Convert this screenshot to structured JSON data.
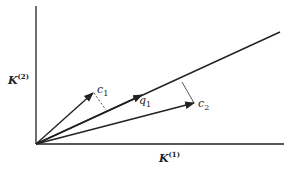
{
  "axes": {
    "x_label": "K",
    "x_label_superscript": "(1)",
    "y_label": "K",
    "y_label_superscript": "(2)"
  },
  "vectors": [
    {
      "name": "c1",
      "label": "c",
      "subscript": "1",
      "tip": [
        93,
        93
      ]
    },
    {
      "name": "q1",
      "label": "q",
      "subscript": "1",
      "tip": [
        280,
        32
      ]
    },
    {
      "name": "c2",
      "label": "c",
      "subscript": "2",
      "tip": [
        194,
        103
      ]
    }
  ],
  "projections": [
    {
      "from": "c1",
      "to_point_on_q1": [
        106,
        110
      ],
      "style": "dashed"
    },
    {
      "from": "c2",
      "to_point_on_q1": [
        182,
        82
      ],
      "style": "thin"
    }
  ],
  "colors": {
    "line": "#222222",
    "background": "#ffffff"
  }
}
